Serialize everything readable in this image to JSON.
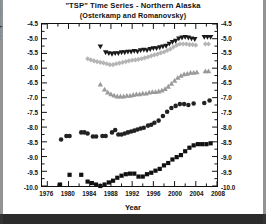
{
  "figure": {
    "title_line1": "\"TSP\" Time Series - Northern Alaska",
    "title_line2": "(Osterkamp and Romanovsky)",
    "xlabel": "Year",
    "ylabel": "Temperature at 20 m depth ( °C )"
  },
  "chart_data": {
    "type": "scatter",
    "title": "\"TSP\" Time Series - Northern Alaska (Osterkamp and Romanovsky)",
    "xlabel": "Year",
    "ylabel": "Temperature at 20 m depth ( °C )",
    "xlim": [
      1975,
      2008
    ],
    "ylim": [
      -10.0,
      -4.5
    ],
    "xticks": [
      1976,
      1980,
      1984,
      1988,
      1992,
      1996,
      2000,
      2004,
      2008
    ],
    "yticks": [
      -4.5,
      -5.0,
      -5.5,
      -6.0,
      -6.5,
      -7.0,
      -7.5,
      -8.0,
      -8.5,
      -9.0,
      -9.5,
      -10.0
    ],
    "ytick_labels": [
      "-4.5",
      "-5.0",
      "-5.5",
      "-6.0",
      "-6.5",
      "-7.0",
      "-7.5",
      "-8.0",
      "-8.5",
      "-9.0",
      "-9.5",
      "-10.0"
    ],
    "xtick_labels": [
      "1976",
      "1980",
      "1984",
      "1988",
      "1992",
      "1996",
      "2000",
      "2004",
      "2008"
    ],
    "grid": false,
    "legend": "annotations-in-plot",
    "minor_ticks": true,
    "right_axis_mirrored": true,
    "series": [
      {
        "name": "Happy Valley",
        "marker": "triangle-down",
        "color": "#1a1a1a",
        "label_x": 1976.2,
        "label_y": -4.72,
        "points": [
          [
            1986.0,
            -5.27
          ],
          [
            1987.0,
            -5.47
          ],
          [
            1987.6,
            -5.5
          ],
          [
            1988.2,
            -5.52
          ],
          [
            1988.8,
            -5.5
          ],
          [
            1989.4,
            -5.5
          ],
          [
            1990.0,
            -5.47
          ],
          [
            1990.6,
            -5.47
          ],
          [
            1991.2,
            -5.45
          ],
          [
            1991.8,
            -5.45
          ],
          [
            1992.4,
            -5.42
          ],
          [
            1993.0,
            -5.44
          ],
          [
            1993.6,
            -5.4
          ],
          [
            1994.2,
            -5.38
          ],
          [
            1994.8,
            -5.4
          ],
          [
            1995.4,
            -5.36
          ],
          [
            1996.0,
            -5.33
          ],
          [
            1996.6,
            -5.33
          ],
          [
            1997.2,
            -5.3
          ],
          [
            1997.8,
            -5.27
          ],
          [
            1998.4,
            -5.25
          ],
          [
            1999.0,
            -5.18
          ],
          [
            1999.6,
            -5.12
          ],
          [
            2000.2,
            -5.08
          ],
          [
            2000.8,
            -5.0
          ],
          [
            2001.4,
            -4.97
          ],
          [
            2002.0,
            -4.95
          ],
          [
            2002.6,
            -4.97
          ],
          [
            2003.2,
            -5.0
          ],
          [
            2003.8,
            -5.02
          ],
          [
            2005.6,
            -4.95
          ],
          [
            2006.2,
            -4.95
          ],
          [
            2006.8,
            -4.95
          ]
        ]
      },
      {
        "name": "Galbraith Lake",
        "marker": "diamond",
        "color": "#b5b5b5",
        "label_x": 1976.2,
        "label_y": -5.68,
        "points": [
          [
            1983.6,
            -5.68
          ],
          [
            1984.2,
            -5.72
          ],
          [
            1984.8,
            -5.75
          ],
          [
            1985.4,
            -5.78
          ],
          [
            1986.0,
            -5.8
          ],
          [
            1986.6,
            -5.82
          ],
          [
            1987.2,
            -5.85
          ],
          [
            1987.8,
            -5.88
          ],
          [
            1988.4,
            -5.88
          ],
          [
            1989.0,
            -5.85
          ],
          [
            1989.6,
            -5.83
          ],
          [
            1990.2,
            -5.8
          ],
          [
            1990.8,
            -5.78
          ],
          [
            1991.4,
            -5.75
          ],
          [
            1992.0,
            -5.73
          ],
          [
            1992.6,
            -5.72
          ],
          [
            1993.2,
            -5.7
          ],
          [
            1993.8,
            -5.68
          ],
          [
            1994.4,
            -5.65
          ],
          [
            1995.0,
            -5.62
          ],
          [
            1995.6,
            -5.58
          ],
          [
            1996.2,
            -5.55
          ],
          [
            1996.8,
            -5.52
          ],
          [
            1997.4,
            -5.48
          ],
          [
            1998.0,
            -5.45
          ],
          [
            1998.6,
            -5.4
          ],
          [
            1999.2,
            -5.35
          ],
          [
            1999.8,
            -5.28
          ],
          [
            2000.4,
            -5.22
          ],
          [
            2001.0,
            -5.18
          ],
          [
            2001.6,
            -5.18
          ],
          [
            2002.2,
            -5.18
          ],
          [
            2002.8,
            -5.2
          ],
          [
            2003.4,
            -5.2
          ],
          [
            2004.0,
            -5.22
          ],
          [
            2005.8,
            -5.18
          ],
          [
            2006.4,
            -5.18
          ]
        ]
      },
      {
        "name": "Franklin Bluffs",
        "marker": "triangle-up",
        "color": "#9a9a9a",
        "label_x": 1976.2,
        "label_y": -7.05,
        "points": [
          [
            1986.0,
            -6.55
          ],
          [
            1986.8,
            -6.72
          ],
          [
            1987.4,
            -6.82
          ],
          [
            1988.0,
            -6.88
          ],
          [
            1988.6,
            -6.92
          ],
          [
            1989.2,
            -6.95
          ],
          [
            1989.8,
            -6.95
          ],
          [
            1990.4,
            -6.95
          ],
          [
            1991.0,
            -6.93
          ],
          [
            1991.6,
            -6.93
          ],
          [
            1992.2,
            -6.9
          ],
          [
            1992.8,
            -6.88
          ],
          [
            1993.4,
            -6.88
          ],
          [
            1994.0,
            -6.85
          ],
          [
            1994.6,
            -6.85
          ],
          [
            1995.2,
            -6.82
          ],
          [
            1995.8,
            -6.8
          ],
          [
            1996.4,
            -6.8
          ],
          [
            1997.0,
            -6.78
          ],
          [
            1997.6,
            -6.75
          ],
          [
            1998.2,
            -6.7
          ],
          [
            1998.8,
            -6.62
          ],
          [
            1999.4,
            -6.52
          ],
          [
            2000.0,
            -6.42
          ],
          [
            2000.6,
            -6.32
          ],
          [
            2001.2,
            -6.25
          ],
          [
            2001.8,
            -6.2
          ],
          [
            2002.4,
            -6.18
          ],
          [
            2003.0,
            -6.15
          ],
          [
            2003.6,
            -6.15
          ],
          [
            2004.2,
            -6.13
          ],
          [
            2005.8,
            -6.1
          ],
          [
            2006.4,
            -6.1
          ]
        ]
      },
      {
        "name": "Deadhorse",
        "marker": "circle",
        "color": "#222222",
        "label_x": 1976.2,
        "label_y": -8.05,
        "points": [
          [
            1978.6,
            -8.42
          ],
          [
            1979.6,
            -8.3
          ],
          [
            1980.2,
            -8.3
          ],
          [
            1982.4,
            -8.18
          ],
          [
            1983.0,
            -8.18
          ],
          [
            1983.6,
            -8.22
          ],
          [
            1984.6,
            -8.32
          ],
          [
            1985.2,
            -8.32
          ],
          [
            1986.4,
            -8.3
          ],
          [
            1987.0,
            -8.3
          ],
          [
            1988.2,
            -8.18
          ],
          [
            1988.8,
            -8.1
          ],
          [
            1989.4,
            -8.25
          ],
          [
            1990.0,
            -8.25
          ],
          [
            1990.6,
            -8.22
          ],
          [
            1991.2,
            -8.18
          ],
          [
            1991.8,
            -8.15
          ],
          [
            1992.4,
            -8.12
          ],
          [
            1993.0,
            -8.08
          ],
          [
            1993.6,
            -8.05
          ],
          [
            1994.2,
            -8.02
          ],
          [
            1995.0,
            -7.95
          ],
          [
            1995.6,
            -7.92
          ],
          [
            1996.2,
            -7.85
          ],
          [
            1997.0,
            -7.78
          ],
          [
            1997.8,
            -7.62
          ],
          [
            1998.6,
            -7.48
          ],
          [
            1999.4,
            -7.35
          ],
          [
            2000.2,
            -7.28
          ],
          [
            2001.0,
            -7.22
          ],
          [
            2001.8,
            -7.22
          ],
          [
            2002.6,
            -7.25
          ],
          [
            2003.6,
            -7.2
          ],
          [
            2005.6,
            -7.18
          ],
          [
            2006.6,
            -7.1
          ]
        ]
      },
      {
        "name": "West Dock",
        "marker": "square",
        "color": "#111111",
        "label_x": 1976.2,
        "label_y": -9.08,
        "points": [
          [
            1978.4,
            -9.95
          ],
          [
            1980.2,
            -9.62
          ],
          [
            1982.4,
            -9.62
          ],
          [
            1983.6,
            -9.85
          ],
          [
            1984.4,
            -9.9
          ],
          [
            1985.2,
            -9.95
          ],
          [
            1986.0,
            -10.0
          ],
          [
            1986.8,
            -9.95
          ],
          [
            1987.6,
            -9.88
          ],
          [
            1988.4,
            -9.82
          ],
          [
            1989.2,
            -9.72
          ],
          [
            1990.0,
            -9.65
          ],
          [
            1990.8,
            -9.6
          ],
          [
            1991.6,
            -9.58
          ],
          [
            1992.4,
            -9.58
          ],
          [
            1993.2,
            -9.68
          ],
          [
            1994.0,
            -9.68
          ],
          [
            1994.8,
            -9.6
          ],
          [
            1995.6,
            -9.55
          ],
          [
            1996.4,
            -9.48
          ],
          [
            1997.2,
            -9.42
          ],
          [
            1998.0,
            -9.3
          ],
          [
            1998.8,
            -9.22
          ],
          [
            1999.6,
            -9.1
          ],
          [
            2000.4,
            -9.02
          ],
          [
            2001.2,
            -8.95
          ],
          [
            2002.0,
            -8.82
          ],
          [
            2002.8,
            -8.7
          ],
          [
            2003.6,
            -8.62
          ],
          [
            2004.4,
            -8.58
          ],
          [
            2005.2,
            -8.58
          ],
          [
            2006.0,
            -8.58
          ],
          [
            2006.8,
            -8.55
          ]
        ]
      }
    ]
  }
}
